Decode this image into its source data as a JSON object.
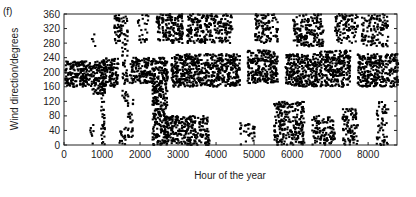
{
  "figure": {
    "panel_label": "(f)",
    "xlabel": "Hour of the year",
    "ylabel": "Wind direction/degrees"
  },
  "chart_data": {
    "type": "scatter",
    "title": "",
    "panel": "(f)",
    "xlabel": "Hour of the year",
    "ylabel": "Wind direction/degrees",
    "xlim": [
      0,
      8760
    ],
    "ylim": [
      0,
      360
    ],
    "xticks": [
      0,
      1000,
      2000,
      3000,
      4000,
      5000,
      6000,
      7000,
      8000
    ],
    "yticks": [
      0,
      40,
      80,
      120,
      160,
      200,
      240,
      280,
      320,
      360
    ],
    "grid": false,
    "legend": null,
    "marker_color": "#000000",
    "clusters": [
      {
        "x": [
          0,
          700
        ],
        "y": [
          160,
          230
        ],
        "density": 1.0
      },
      {
        "x": [
          700,
          1000
        ],
        "y": [
          140,
          230
        ],
        "density": 0.9
      },
      {
        "x": [
          650,
          750
        ],
        "y": [
          0,
          60
        ],
        "density": 0.3
      },
      {
        "x": [
          700,
          800
        ],
        "y": [
          270,
          310
        ],
        "density": 0.3
      },
      {
        "x": [
          950,
          1050
        ],
        "y": [
          0,
          200
        ],
        "density": 0.5
      },
      {
        "x": [
          1000,
          1400
        ],
        "y": [
          160,
          240
        ],
        "density": 0.9
      },
      {
        "x": [
          1300,
          1500
        ],
        "y": [
          280,
          360
        ],
        "density": 0.7
      },
      {
        "x": [
          1400,
          1600
        ],
        "y": [
          0,
          50
        ],
        "density": 0.4
      },
      {
        "x": [
          1500,
          1650
        ],
        "y": [
          120,
          360
        ],
        "density": 0.4
      },
      {
        "x": [
          1650,
          1800
        ],
        "y": [
          20,
          140
        ],
        "density": 0.4
      },
      {
        "x": [
          1700,
          2300
        ],
        "y": [
          170,
          240
        ],
        "density": 0.9
      },
      {
        "x": [
          1900,
          2200
        ],
        "y": [
          280,
          360
        ],
        "density": 0.25
      },
      {
        "x": [
          2300,
          2700
        ],
        "y": [
          0,
          240
        ],
        "density": 0.8
      },
      {
        "x": [
          2400,
          3100
        ],
        "y": [
          280,
          360
        ],
        "density": 0.7
      },
      {
        "x": [
          2600,
          3800
        ],
        "y": [
          0,
          80
        ],
        "density": 0.7
      },
      {
        "x": [
          2800,
          4600
        ],
        "y": [
          160,
          250
        ],
        "density": 0.85
      },
      {
        "x": [
          3200,
          4400
        ],
        "y": [
          280,
          360
        ],
        "density": 0.6
      },
      {
        "x": [
          4600,
          5000
        ],
        "y": [
          0,
          60
        ],
        "density": 0.3
      },
      {
        "x": [
          4800,
          5600
        ],
        "y": [
          170,
          260
        ],
        "density": 0.85
      },
      {
        "x": [
          5000,
          5600
        ],
        "y": [
          280,
          360
        ],
        "density": 0.55
      },
      {
        "x": [
          5500,
          6300
        ],
        "y": [
          0,
          120
        ],
        "density": 0.6
      },
      {
        "x": [
          5800,
          6700
        ],
        "y": [
          160,
          250
        ],
        "density": 0.85
      },
      {
        "x": [
          6000,
          6800
        ],
        "y": [
          270,
          360
        ],
        "density": 0.6
      },
      {
        "x": [
          6500,
          7100
        ],
        "y": [
          0,
          80
        ],
        "density": 0.55
      },
      {
        "x": [
          6700,
          7500
        ],
        "y": [
          160,
          260
        ],
        "density": 0.8
      },
      {
        "x": [
          7100,
          7700
        ],
        "y": [
          280,
          360
        ],
        "density": 0.5
      },
      {
        "x": [
          7300,
          7700
        ],
        "y": [
          0,
          100
        ],
        "density": 0.55
      },
      {
        "x": [
          7700,
          8760
        ],
        "y": [
          160,
          250
        ],
        "density": 0.8
      },
      {
        "x": [
          7800,
          8500
        ],
        "y": [
          270,
          360
        ],
        "density": 0.45
      },
      {
        "x": [
          8200,
          8500
        ],
        "y": [
          0,
          120
        ],
        "density": 0.35
      }
    ]
  }
}
